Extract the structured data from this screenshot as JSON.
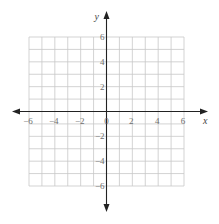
{
  "chart_data": {
    "type": "coordinate-grid",
    "title": "",
    "xlabel": "x",
    "ylabel": "y",
    "xlim": [
      -6,
      6
    ],
    "ylim": [
      -6,
      6
    ],
    "grid": true,
    "grid_step": 1,
    "x_ticks": [
      -6,
      -4,
      -2,
      0,
      2,
      4,
      6
    ],
    "y_ticks": [
      6,
      4,
      2,
      -2,
      -4,
      -6
    ],
    "x_tick_labels": [
      "−6",
      "−4",
      "−2",
      "0",
      "2",
      "4",
      "6"
    ],
    "y_tick_labels": [
      "6",
      "4",
      "2",
      "−2",
      "−4",
      "−6"
    ],
    "axes_arrows": true
  }
}
